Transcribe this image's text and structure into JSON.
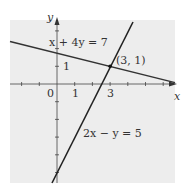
{
  "figure": {
    "background_color": "#ededed",
    "line_color": "#333333",
    "axes": {
      "x_label": "x",
      "y_label": "y",
      "origin_label": "0",
      "x_tick_labels": [
        "1",
        "3"
      ],
      "y_tick_labels": [
        "1"
      ]
    },
    "lines": [
      {
        "equation": "x + 4y = 7"
      },
      {
        "equation": "2x − y = 5"
      }
    ],
    "intersection": {
      "label": "(3, 1)",
      "x": 3,
      "y": 1
    }
  }
}
